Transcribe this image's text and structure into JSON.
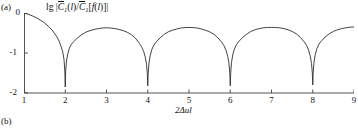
{
  "panels": {
    "a_label": "(a)",
    "b_label": "(b)"
  },
  "axis_titles": {
    "y_prefix": "lg |",
    "y_c_symbol": "C",
    "y_sub1": "1",
    "y_mid": "(",
    "y_var_l": "l",
    "y_slash": ")/",
    "y_c_symbol2": "C",
    "y_sub2": "1",
    "y_bracket_open": "[",
    "y_f": "f",
    "y_paren_open": "(",
    "y_var_l2": "l",
    "y_paren_close": ")",
    "y_bracket_close": "]",
    "y_suffix": "|",
    "x_two": "2",
    "x_delta": "Δ",
    "x_u": "u",
    "x_l": "l"
  },
  "y_ticks": [
    "0",
    "-1",
    "-2"
  ],
  "x_ticks": [
    "1",
    "2",
    "3",
    "4",
    "5",
    "6",
    "7",
    "8",
    "9"
  ],
  "chart_data": {
    "type": "line",
    "title": "",
    "xlabel": "2Δul",
    "ylabel": "lg |C̄1(l)/C̄1[f(l)]|",
    "xlim": [
      1,
      9
    ],
    "ylim": [
      -2,
      0
    ],
    "grid": false,
    "legend": "none",
    "cusp_x": [
      2,
      4,
      6,
      8
    ],
    "cusp_y": [
      -1.85,
      -1.82,
      -1.82,
      -1.8
    ],
    "peak_x": [
      3,
      5,
      7
    ],
    "peak_y": [
      -0.37,
      -0.36,
      -0.36
    ],
    "series": [
      {
        "name": "lg |C1(l)/C1[f(l)]|",
        "x": [
          1.0,
          1.1,
          1.2,
          1.3,
          1.4,
          1.5,
          1.6,
          1.7,
          1.8,
          1.85,
          1.9,
          1.94,
          1.97,
          1.99,
          2.0,
          2.01,
          2.03,
          2.06,
          2.1,
          2.15,
          2.2,
          2.3,
          2.4,
          2.5,
          2.6,
          2.7,
          2.8,
          2.9,
          3.0,
          3.1,
          3.2,
          3.3,
          3.4,
          3.5,
          3.6,
          3.7,
          3.8,
          3.85,
          3.9,
          3.94,
          3.97,
          3.99,
          4.0,
          4.01,
          4.03,
          4.06,
          4.1,
          4.15,
          4.2,
          4.3,
          4.4,
          4.5,
          4.6,
          4.7,
          4.8,
          4.9,
          5.0,
          5.1,
          5.2,
          5.3,
          5.4,
          5.5,
          5.6,
          5.7,
          5.8,
          5.85,
          5.9,
          5.94,
          5.97,
          5.99,
          6.0,
          6.01,
          6.03,
          6.06,
          6.1,
          6.15,
          6.2,
          6.3,
          6.4,
          6.5,
          6.6,
          6.7,
          6.8,
          6.9,
          7.0,
          7.1,
          7.2,
          7.3,
          7.4,
          7.5,
          7.6,
          7.7,
          7.8,
          7.85,
          7.9,
          7.94,
          7.97,
          7.99,
          8.0,
          8.01,
          8.03,
          8.06,
          8.1,
          8.15,
          8.2,
          8.3,
          8.4,
          8.5,
          8.6,
          8.7,
          8.8,
          8.9,
          9.0
        ],
        "y": [
          0.0,
          -0.03,
          -0.07,
          -0.12,
          -0.18,
          -0.25,
          -0.34,
          -0.45,
          -0.6,
          -0.7,
          -0.84,
          -0.98,
          -1.16,
          -1.45,
          -1.85,
          -1.45,
          -1.2,
          -1.02,
          -0.88,
          -0.78,
          -0.72,
          -0.62,
          -0.54,
          -0.48,
          -0.44,
          -0.41,
          -0.39,
          -0.375,
          -0.37,
          -0.375,
          -0.39,
          -0.41,
          -0.44,
          -0.48,
          -0.54,
          -0.63,
          -0.76,
          -0.84,
          -0.96,
          -1.1,
          -1.28,
          -1.52,
          -1.82,
          -1.52,
          -1.25,
          -1.06,
          -0.91,
          -0.8,
          -0.73,
          -0.62,
          -0.53,
          -0.47,
          -0.43,
          -0.4,
          -0.375,
          -0.365,
          -0.36,
          -0.365,
          -0.375,
          -0.4,
          -0.43,
          -0.47,
          -0.53,
          -0.62,
          -0.74,
          -0.82,
          -0.94,
          -1.09,
          -1.27,
          -1.51,
          -1.82,
          -1.51,
          -1.24,
          -1.05,
          -0.9,
          -0.79,
          -0.72,
          -0.61,
          -0.53,
          -0.46,
          -0.42,
          -0.39,
          -0.37,
          -0.362,
          -0.36,
          -0.362,
          -0.37,
          -0.39,
          -0.42,
          -0.46,
          -0.52,
          -0.61,
          -0.73,
          -0.81,
          -0.93,
          -1.08,
          -1.26,
          -1.5,
          -1.8,
          -1.5,
          -1.23,
          -1.04,
          -0.89,
          -0.78,
          -0.71,
          -0.6,
          -0.52,
          -0.46,
          -0.42,
          -0.39,
          -0.37,
          -0.355,
          -0.35
        ]
      }
    ]
  }
}
